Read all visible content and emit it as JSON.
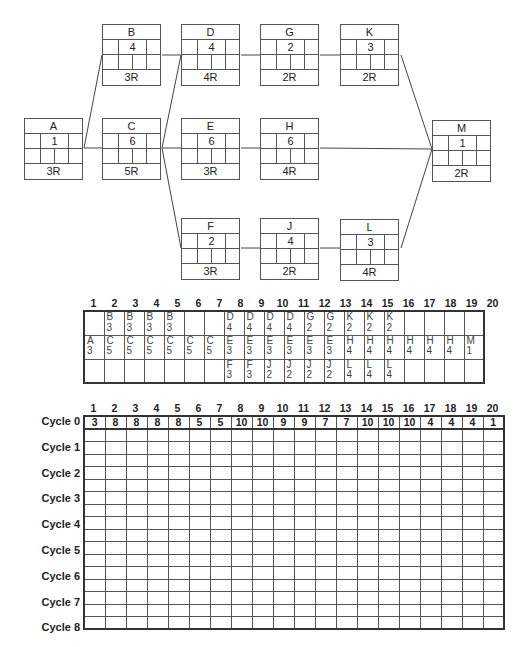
{
  "network": {
    "nodes": [
      {
        "id": "A",
        "duration": "1",
        "resources": "3R"
      },
      {
        "id": "B",
        "duration": "4",
        "resources": "3R"
      },
      {
        "id": "C",
        "duration": "6",
        "resources": "5R"
      },
      {
        "id": "D",
        "duration": "4",
        "resources": "4R"
      },
      {
        "id": "E",
        "duration": "6",
        "resources": "3R"
      },
      {
        "id": "F",
        "duration": "2",
        "resources": "3R"
      },
      {
        "id": "G",
        "duration": "2",
        "resources": "2R"
      },
      {
        "id": "H",
        "duration": "6",
        "resources": "4R"
      },
      {
        "id": "J",
        "duration": "4",
        "resources": "2R"
      },
      {
        "id": "K",
        "duration": "3",
        "resources": "2R"
      },
      {
        "id": "L",
        "duration": "3",
        "resources": "4R"
      },
      {
        "id": "M",
        "duration": "1",
        "resources": "2R"
      }
    ],
    "edges": [
      [
        "A",
        "B"
      ],
      [
        "A",
        "C"
      ],
      [
        "B",
        "D"
      ],
      [
        "C",
        "D"
      ],
      [
        "C",
        "E"
      ],
      [
        "C",
        "F"
      ],
      [
        "D",
        "G"
      ],
      [
        "G",
        "K"
      ],
      [
        "E",
        "H"
      ],
      [
        "F",
        "J"
      ],
      [
        "J",
        "L"
      ],
      [
        "K",
        "M"
      ],
      [
        "H",
        "M"
      ],
      [
        "L",
        "M"
      ]
    ]
  },
  "schedule": {
    "periods": [
      "1",
      "2",
      "3",
      "4",
      "5",
      "6",
      "7",
      "8",
      "9",
      "10",
      "11",
      "12",
      "13",
      "14",
      "15",
      "16",
      "17",
      "18",
      "19",
      "20"
    ],
    "rows": [
      [
        [
          "",
          ""
        ],
        [
          "B",
          "3"
        ],
        [
          "B",
          "3"
        ],
        [
          "B",
          "3"
        ],
        [
          "B",
          "3"
        ],
        [
          "",
          ""
        ],
        [
          "",
          ""
        ],
        [
          "D",
          "4"
        ],
        [
          "D",
          "4"
        ],
        [
          "D",
          "4"
        ],
        [
          "D",
          "4"
        ],
        [
          "G",
          "2"
        ],
        [
          "G",
          "2"
        ],
        [
          "K",
          "2"
        ],
        [
          "K",
          "2"
        ],
        [
          "K",
          "2"
        ],
        [
          "",
          ""
        ],
        [
          "",
          ""
        ],
        [
          "",
          ""
        ],
        [
          "",
          ""
        ]
      ],
      [
        [
          "A",
          "3"
        ],
        [
          "C",
          "5"
        ],
        [
          "C",
          "5"
        ],
        [
          "C",
          "5"
        ],
        [
          "C",
          "5"
        ],
        [
          "C",
          "5"
        ],
        [
          "C",
          "5"
        ],
        [
          "E",
          "3"
        ],
        [
          "E",
          "3"
        ],
        [
          "E",
          "3"
        ],
        [
          "E",
          "3"
        ],
        [
          "E",
          "3"
        ],
        [
          "E",
          "3"
        ],
        [
          "H",
          "4"
        ],
        [
          "H",
          "4"
        ],
        [
          "H",
          "4"
        ],
        [
          "H",
          "4"
        ],
        [
          "H",
          "4"
        ],
        [
          "H",
          "4"
        ],
        [
          "M",
          "1"
        ]
      ],
      [
        [
          "",
          ""
        ],
        [
          "",
          ""
        ],
        [
          "",
          ""
        ],
        [
          "",
          ""
        ],
        [
          "",
          ""
        ],
        [
          "",
          ""
        ],
        [
          "",
          ""
        ],
        [
          "F",
          "3"
        ],
        [
          "F",
          "3"
        ],
        [
          "J",
          "2"
        ],
        [
          "J",
          "2"
        ],
        [
          "J",
          "2"
        ],
        [
          "J",
          "2"
        ],
        [
          "L",
          "4"
        ],
        [
          "L",
          "4"
        ],
        [
          "L",
          "4"
        ],
        [
          "",
          ""
        ],
        [
          "",
          ""
        ],
        [
          "",
          ""
        ],
        [
          "",
          ""
        ]
      ]
    ]
  },
  "resource_table": {
    "periods": [
      "1",
      "2",
      "3",
      "4",
      "5",
      "6",
      "7",
      "8",
      "9",
      "10",
      "11",
      "12",
      "13",
      "14",
      "15",
      "16",
      "17",
      "18",
      "19",
      "20"
    ],
    "cycles": [
      {
        "label": "Cycle 0",
        "values": [
          "3",
          "8",
          "8",
          "8",
          "8",
          "5",
          "5",
          "10",
          "10",
          "9",
          "9",
          "7",
          "7",
          "10",
          "10",
          "10",
          "4",
          "4",
          "4",
          "1"
        ]
      },
      {
        "label": "Cycle 1",
        "values": []
      },
      {
        "label": "Cycle 2",
        "values": []
      },
      {
        "label": "Cycle 3",
        "values": []
      },
      {
        "label": "Cycle 4",
        "values": []
      },
      {
        "label": "Cycle 5",
        "values": []
      },
      {
        "label": "Cycle 6",
        "values": []
      },
      {
        "label": "Cycle 7",
        "values": []
      },
      {
        "label": "Cycle 8",
        "values": []
      }
    ]
  }
}
